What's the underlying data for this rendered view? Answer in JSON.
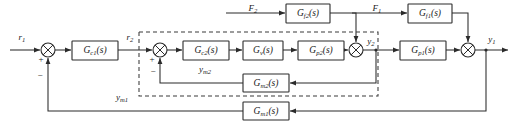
{
  "diagram": {
    "type": "control-block-diagram",
    "colors": {
      "line": "#2b2b2b",
      "dashed_line": "#3a3a3a",
      "block_fill": "#ffffff",
      "background": "#ffffff",
      "text": "#1a1a1a"
    },
    "blocks": [
      {
        "id": "gc1",
        "label": "G",
        "sub": "c1",
        "tail": "(s)",
        "x": 72,
        "y": 41,
        "w": 46,
        "h": 19
      },
      {
        "id": "gc2",
        "label": "G",
        "sub": "c2",
        "tail": "(s)",
        "x": 183,
        "y": 41,
        "w": 46,
        "h": 19
      },
      {
        "id": "gv",
        "label": "G",
        "sub": "v",
        "tail": "(s)",
        "x": 243,
        "y": 41,
        "w": 40,
        "h": 19
      },
      {
        "id": "gp2",
        "label": "G",
        "sub": "p2",
        "tail": "(s)",
        "x": 298,
        "y": 41,
        "w": 46,
        "h": 19
      },
      {
        "id": "gp1",
        "label": "G",
        "sub": "p1",
        "tail": "(s)",
        "x": 400,
        "y": 41,
        "w": 46,
        "h": 19
      },
      {
        "id": "gf2",
        "label": "G",
        "sub": "f2",
        "tail": "(s)",
        "x": 286,
        "y": 4,
        "w": 44,
        "h": 19
      },
      {
        "id": "gf1",
        "label": "G",
        "sub": "f1",
        "tail": "(s)",
        "x": 408,
        "y": 4,
        "w": 44,
        "h": 19
      },
      {
        "id": "gm2",
        "label": "G",
        "sub": "m2",
        "tail": "(s)",
        "x": 243,
        "y": 74,
        "w": 46,
        "h": 18
      },
      {
        "id": "gm1",
        "label": "G",
        "sub": "m1",
        "tail": "(s)",
        "x": 243,
        "y": 102,
        "w": 46,
        "h": 18
      }
    ],
    "summers": [
      {
        "id": "sum1",
        "cx": 48,
        "cy": 50,
        "r": 7
      },
      {
        "id": "sum2",
        "cx": 160,
        "cy": 50,
        "r": 7
      },
      {
        "id": "sum3",
        "cx": 356,
        "cy": 50,
        "r": 7
      },
      {
        "id": "sum4",
        "cx": 468,
        "cy": 50,
        "r": 7
      }
    ],
    "signals": [
      {
        "id": "r1",
        "label": "r",
        "sub": "1",
        "x": 22,
        "y": 38
      },
      {
        "id": "r2",
        "label": "r",
        "sub": "2",
        "x": 130,
        "y": 38
      },
      {
        "id": "y2",
        "label": "y",
        "sub": "2",
        "x": 374,
        "y": 42
      },
      {
        "id": "y1",
        "label": "y",
        "sub": "1",
        "x": 492,
        "y": 40
      },
      {
        "id": "F2",
        "label": "F",
        "sub": "2",
        "x": 253,
        "y": 10
      },
      {
        "id": "F1",
        "label": "F",
        "sub": "1",
        "x": 375,
        "y": 10
      },
      {
        "id": "ym2",
        "label": "y",
        "sub": "m2",
        "x": 205,
        "y": 70
      },
      {
        "id": "ym1",
        "label": "y",
        "sub": "m1",
        "x": 122,
        "y": 98
      }
    ],
    "signs": [
      {
        "id": "sum1-plus",
        "text": "+",
        "x": 41,
        "y": 60
      },
      {
        "id": "sum1-minus",
        "text": "−",
        "x": 40,
        "y": 78
      },
      {
        "id": "sum2-plus",
        "text": "+",
        "x": 152,
        "y": 60
      },
      {
        "id": "sum2-minus",
        "text": "−",
        "x": 152,
        "y": 70
      }
    ]
  }
}
